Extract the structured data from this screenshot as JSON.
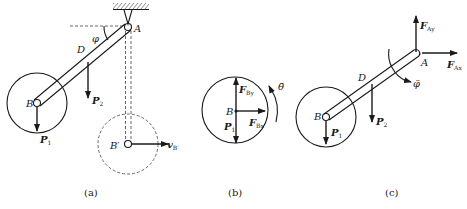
{
  "figure": {
    "panels": [
      {
        "id": "a",
        "caption": "(a)",
        "labels": {
          "pivot": "A",
          "end": "B",
          "mid": "D",
          "angle": "φ",
          "end_prime": "B′",
          "force_p1": "P",
          "force_p1_sub": "1",
          "force_p2": "P",
          "force_p2_sub": "2",
          "velocity": "v",
          "velocity_sub": "B′"
        }
      },
      {
        "id": "b",
        "caption": "(b)",
        "labels": {
          "center": "B",
          "force_by": "F",
          "force_by_sub": "By",
          "force_bx": "F",
          "force_bx_sub": "Bx",
          "force_p1": "P",
          "force_p1_sub": "1",
          "angular_accel": "θ̈"
        }
      },
      {
        "id": "c",
        "caption": "(c)",
        "labels": {
          "pivot": "A",
          "end": "B",
          "mid": "D",
          "force_ay": "F",
          "force_ay_sub": "Ay",
          "force_ax": "F",
          "force_ax_sub": "Ax",
          "force_p1": "P",
          "force_p1_sub": "1",
          "force_p2": "P",
          "force_p2_sub": "2",
          "angular_accel": "φ̈"
        }
      }
    ]
  }
}
